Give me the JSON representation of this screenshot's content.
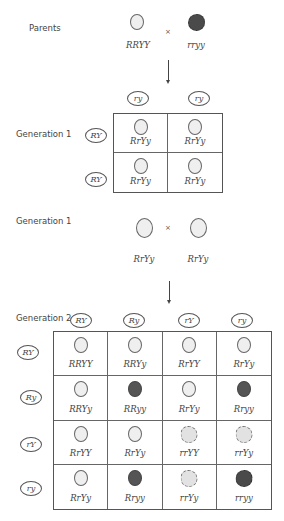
{
  "parents": {
    "label": "Parents",
    "cross_symbol": "×",
    "left": {
      "genotype": "RRYY",
      "phenotype": "yellow-round"
    },
    "right": {
      "genotype": "rryy",
      "phenotype": "green-wrinkled"
    }
  },
  "generation1_square": {
    "label": "Generation 1",
    "column_gametes": [
      "ry",
      "ry"
    ],
    "row_gametes": [
      "RY",
      "RY"
    ],
    "cells": [
      [
        {
          "genotype": "RrYy",
          "phenotype": "yellow-round"
        },
        {
          "genotype": "RrYy",
          "phenotype": "yellow-round"
        }
      ],
      [
        {
          "genotype": "RrYy",
          "phenotype": "yellow-round"
        },
        {
          "genotype": "RrYy",
          "phenotype": "yellow-round"
        }
      ]
    ]
  },
  "generation1_cross": {
    "label": "Generation 1",
    "cross_symbol": "×",
    "left": {
      "genotype": "RrYy",
      "phenotype": "yellow-round"
    },
    "right": {
      "genotype": "RrYy",
      "phenotype": "yellow-round"
    }
  },
  "generation2_square": {
    "label": "Generation 2",
    "column_gametes": [
      "RY",
      "Ry",
      "rY",
      "ry"
    ],
    "row_gametes": [
      "RY",
      "Ry",
      "rY",
      "ry"
    ],
    "cells": [
      [
        {
          "genotype": "RRYY",
          "phenotype": "yellow-round"
        },
        {
          "genotype": "RRYy",
          "phenotype": "yellow-round"
        },
        {
          "genotype": "RrYY",
          "phenotype": "yellow-round"
        },
        {
          "genotype": "RrYy",
          "phenotype": "yellow-round"
        }
      ],
      [
        {
          "genotype": "RRYy",
          "phenotype": "yellow-round"
        },
        {
          "genotype": "RRyy",
          "phenotype": "green-round"
        },
        {
          "genotype": "RrYy",
          "phenotype": "yellow-round"
        },
        {
          "genotype": "Rryy",
          "phenotype": "green-round"
        }
      ],
      [
        {
          "genotype": "RrYY",
          "phenotype": "yellow-round"
        },
        {
          "genotype": "RrYy",
          "phenotype": "yellow-round"
        },
        {
          "genotype": "rrYY",
          "phenotype": "yellow-wrinkled"
        },
        {
          "genotype": "rrYy",
          "phenotype": "yellow-wrinkled"
        }
      ],
      [
        {
          "genotype": "RrYy",
          "phenotype": "yellow-round"
        },
        {
          "genotype": "Rryy",
          "phenotype": "green-round"
        },
        {
          "genotype": "rrYy",
          "phenotype": "yellow-wrinkled"
        },
        {
          "genotype": "rryy",
          "phenotype": "green-wrinkled"
        }
      ]
    ]
  },
  "phenotype_colors": {
    "yellow-round": "#efefef",
    "green-round": "#555555",
    "yellow-wrinkled": "#e2e2e2",
    "green-wrinkled": "#4a4a4a"
  }
}
